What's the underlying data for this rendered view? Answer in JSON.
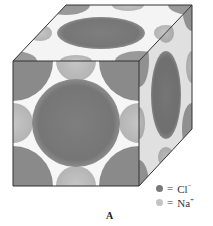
{
  "diagram": {
    "type": "crystal-lattice-unit-cell",
    "caption": "A",
    "colors": {
      "cl_ion": "#7a7a7a",
      "na_ion": "#bdbdbd",
      "edge": "#333333",
      "background": "#ffffff"
    },
    "legend": [
      {
        "symbol": "dark-circle",
        "equals": "=",
        "ion": "Cl",
        "charge": "−"
      },
      {
        "symbol": "light-circle",
        "equals": "=",
        "ion": "Na",
        "charge": "+"
      }
    ]
  }
}
